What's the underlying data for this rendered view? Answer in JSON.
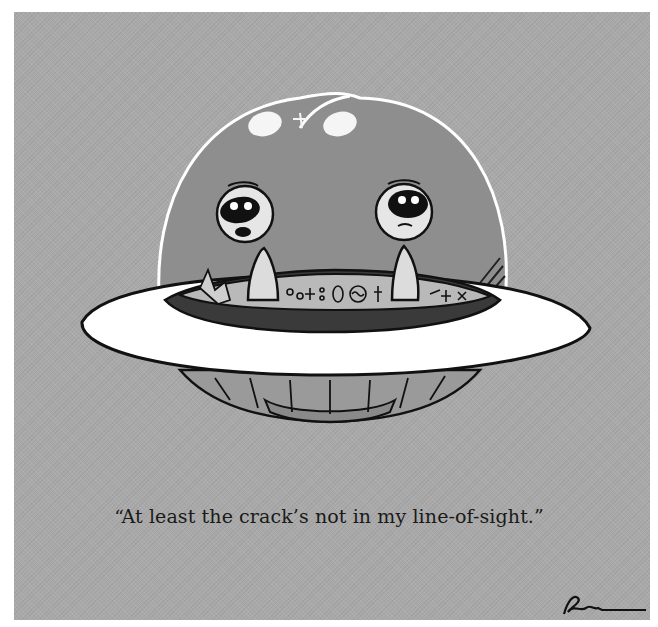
{
  "cartoon": {
    "caption": "“At least the crack’s not in my line-of-sight.”",
    "signature": "Rogan",
    "scene": "Two aliens in a flying saucer with a cracked glass dome",
    "colors": {
      "background": "#a9a9a9",
      "dome": "#8f8f8f",
      "saucer": "#ffffff",
      "ink": "#111111"
    }
  }
}
